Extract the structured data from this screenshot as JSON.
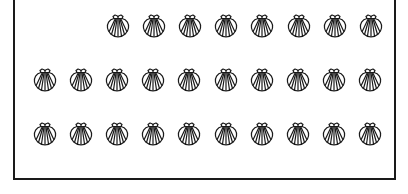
{
  "figure": {
    "stroke_color": "#1a1a1a",
    "background": "#ffffff",
    "rows": [
      {
        "count": 8,
        "start_x": 105,
        "y": 13
      },
      {
        "count": 10,
        "start_x": 32,
        "y": 67
      },
      {
        "count": 10,
        "start_x": 32,
        "y": 121
      }
    ],
    "spacing": 36.1,
    "total_shells": 28,
    "icon": "scallop-shell-icon"
  }
}
